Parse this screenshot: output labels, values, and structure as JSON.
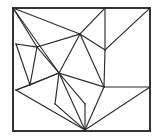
{
  "figure": {
    "name": "triangulated-polygon-mesh",
    "kind": "line-drawing",
    "background_color": "#ffffff",
    "line_color": "#2b2b2b",
    "frame_stroke_width": 1.9,
    "edge_stroke_width": 1.15,
    "canvas": {
      "width": 158,
      "height": 139
    }
  },
  "chart_data": {
    "type": "diagram",
    "title": "",
    "xlabel": "",
    "ylabel": "",
    "vertices": {
      "frame_tl": [
        13,
        8
      ],
      "frame_tr": [
        150,
        8
      ],
      "frame_br": [
        150,
        131
      ],
      "frame_bl": [
        13,
        131
      ],
      "top_mid": [
        105,
        8
      ],
      "left_upper": [
        16,
        44
      ],
      "left_lower": [
        16,
        90
      ],
      "right_mid": [
        150,
        87
      ],
      "bottom_apex": [
        85,
        130
      ],
      "hub": [
        59,
        73
      ],
      "node_upper_mid": [
        80,
        34
      ],
      "node_left_inner": [
        37,
        47
      ],
      "node_right_inner": [
        104,
        87
      ],
      "node_fan": [
        105,
        50
      ],
      "node_low_left": [
        30,
        85
      ],
      "node_low_mid": [
        55,
        104
      ],
      "node_bottom_edge": [
        85,
        104
      ]
    },
    "edges": [
      [
        "frame_tl",
        "node_upper_mid"
      ],
      [
        "frame_tl",
        "node_left_inner"
      ],
      [
        "frame_tl",
        "hub"
      ],
      [
        "left_upper",
        "node_left_inner"
      ],
      [
        "left_upper",
        "node_low_left"
      ],
      [
        "node_left_inner",
        "node_upper_mid"
      ],
      [
        "node_left_inner",
        "hub"
      ],
      [
        "node_left_inner",
        "node_low_left"
      ],
      [
        "node_upper_mid",
        "top_mid"
      ],
      [
        "node_upper_mid",
        "hub"
      ],
      [
        "node_upper_mid",
        "node_fan"
      ],
      [
        "node_upper_mid",
        "node_right_inner"
      ],
      [
        "top_mid",
        "top_mid_down"
      ],
      [
        "node_fan",
        "frame_tr"
      ],
      [
        "node_fan",
        "node_right_inner"
      ],
      [
        "hub",
        "node_right_inner"
      ],
      [
        "hub",
        "node_low_left"
      ],
      [
        "hub",
        "left_lower"
      ],
      [
        "hub",
        "node_low_mid"
      ],
      [
        "hub",
        "node_bottom_edge"
      ],
      [
        "hub",
        "bottom_apex"
      ],
      [
        "node_low_left",
        "left_lower"
      ],
      [
        "left_lower",
        "bottom_apex"
      ],
      [
        "node_low_mid",
        "bottom_apex"
      ],
      [
        "node_bottom_edge",
        "bottom_apex"
      ],
      [
        "node_right_inner",
        "right_mid"
      ],
      [
        "node_right_inner",
        "bottom_apex"
      ],
      [
        "right_mid",
        "bottom_apex"
      ]
    ],
    "vertex_count": 17,
    "edge_count": 28,
    "grid": false,
    "legend": null
  }
}
